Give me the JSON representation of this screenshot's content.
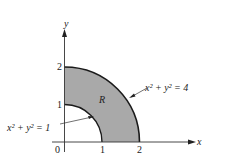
{
  "diagram": {
    "region_label": "R",
    "axes": {
      "x_label": "x",
      "y_label": "y",
      "origin_label": "0"
    },
    "ticks": {
      "x": [
        "1",
        "2"
      ],
      "y": [
        "1",
        "2"
      ]
    },
    "curves": {
      "outer": {
        "equation": "x² + y² = 4"
      },
      "inner": {
        "equation": "x² + y² = 1"
      }
    },
    "colors": {
      "fill": "#a8a8a8",
      "line": "#1a1a1a"
    }
  }
}
